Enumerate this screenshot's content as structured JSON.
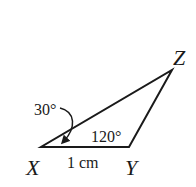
{
  "diagram": {
    "type": "triangle",
    "vertices": [
      {
        "name": "X",
        "label": "X"
      },
      {
        "name": "Y",
        "label": "Y"
      },
      {
        "name": "Z",
        "label": "Z"
      }
    ],
    "angles": {
      "X": "30°",
      "Y": "120°"
    },
    "sides": {
      "XY": "1 cm"
    },
    "colors": {
      "stroke": "#1a1a1a",
      "background": "#ffffff"
    }
  }
}
